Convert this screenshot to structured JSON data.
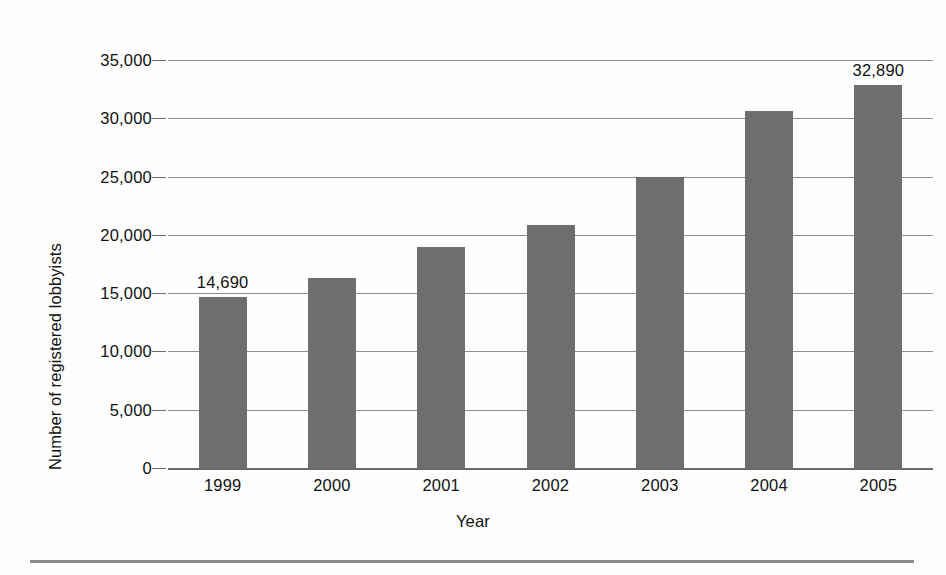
{
  "chart_data": {
    "type": "bar",
    "title": "",
    "subtitle": "",
    "xlabel": "Year",
    "ylabel": "Number of registered lobbyists",
    "categories": [
      "1999",
      "2000",
      "2001",
      "2002",
      "2003",
      "2004",
      "2005"
    ],
    "values": [
      14690,
      16342,
      18992,
      20873,
      24946,
      30600,
      32890
    ],
    "value_labels": [
      "14,690",
      "",
      "",
      "",
      "",
      "",
      "32,890"
    ],
    "labeled_points": [
      {
        "category": "1999",
        "value": 14690,
        "label": "14,690"
      },
      {
        "category": "2005",
        "value": 32890,
        "label": "32,890"
      }
    ],
    "ylim": [
      0,
      35000
    ],
    "ytick_values": [
      0,
      5000,
      10000,
      15000,
      20000,
      25000,
      30000,
      35000
    ],
    "ytick_labels": [
      "0",
      "5,000",
      "10,000",
      "15,000",
      "20,000",
      "25,000",
      "30,000",
      "35,000"
    ],
    "ytick_step": 5000,
    "grid": true,
    "grid_axis": "y",
    "legend": false,
    "legend_position": "none",
    "bar_color": "#6e6e6e",
    "gridline_color": "#8e8e8e",
    "axis_color": "#6a6a6a",
    "text_color": "#111111",
    "background_color": "#fefefe"
  },
  "figure": {
    "y_axis_title": "Number of registered lobbyists",
    "x_axis_title": "Year"
  }
}
